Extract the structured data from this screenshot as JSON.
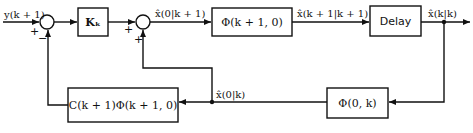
{
  "diagram": {
    "input_label": "y(k + 1)",
    "output_label": "x̂(k|k)",
    "blocks": {
      "gain": "Kₖ",
      "phi_forward": "Φ(k + 1, 0)",
      "delay": "Delay",
      "phi_back": "Φ(0, k)",
      "measurement": "C(k + 1)Φ(k + 1, 0)"
    },
    "signals": {
      "x0_k1": "x̂(0|k + 1)",
      "xk1_k1": "x̂(k + 1|k + 1)",
      "xk_k": "x̂(k|k)",
      "x0_k": "x̂(0|k)"
    },
    "junctions": {
      "sum1": {
        "top_sign": "+",
        "bottom_sign": "−"
      },
      "sum2": {
        "left_sign": "+",
        "bottom_sign": "+"
      }
    }
  }
}
